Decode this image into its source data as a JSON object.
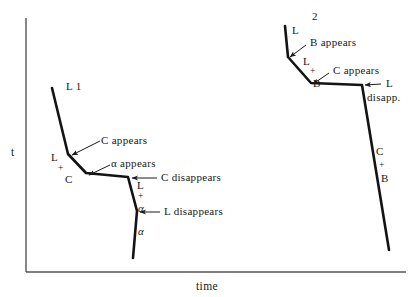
{
  "figure": {
    "background": "#ffffff",
    "ink": "#151515",
    "axis_color": "#4a4a4a",
    "axes": {
      "y_label": "t",
      "x_label": "time"
    },
    "curves": [
      {
        "name": "curve-L1",
        "label": "L 1",
        "points": "52,88 68,154 86,173 128,177 137,211 133,258"
      },
      {
        "name": "curve-L2",
        "label_main": "L",
        "label_sup": "2",
        "points": "285,26 288,57 311,83 362,85 389,250"
      }
    ],
    "annotations_left": [
      {
        "name": "annotation-c-appears-left",
        "text": "C appears"
      },
      {
        "name": "annotation-alpha-appears",
        "text": "α appears"
      },
      {
        "name": "annotation-c-disappears",
        "text": "C disappears"
      },
      {
        "name": "annotation-l-disappears",
        "text": "L disappears"
      }
    ],
    "phase_labels_left": [
      {
        "name": "phase-label-L-plus-C",
        "line1": "L",
        "line2": "+",
        "line3": "C"
      },
      {
        "name": "phase-label-L-plus-alpha",
        "line1": "L",
        "line2": "+",
        "line3": "α"
      },
      {
        "name": "phase-label-alpha",
        "text": "α"
      }
    ],
    "annotations_right": [
      {
        "name": "annotation-b-appears",
        "text": "B appears"
      },
      {
        "name": "annotation-c-appears-right",
        "text": "C appears"
      },
      {
        "name": "annotation-l-disapp",
        "line1": "L",
        "line2": "disapp."
      }
    ],
    "phase_labels_right": [
      {
        "name": "phase-label-L-plus-B",
        "line1": "L",
        "line2": "+",
        "line3": "B"
      },
      {
        "name": "phase-label-C-plus-B",
        "line1": "C",
        "line2": "+",
        "line3": "B"
      }
    ]
  }
}
